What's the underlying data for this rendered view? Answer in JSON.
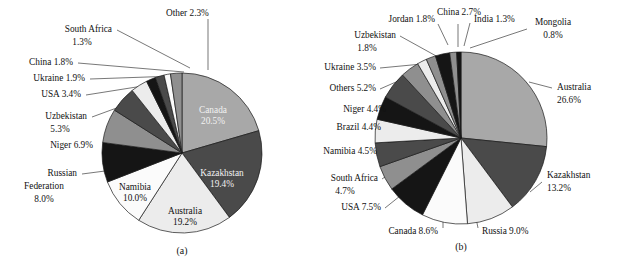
{
  "figure": {
    "width": 626,
    "height": 277,
    "background": "#ffffff",
    "panels": [
      {
        "id": "a",
        "caption": "(a)",
        "center": {
          "x": 182,
          "y": 153
        },
        "radius": 80
      },
      {
        "id": "b",
        "caption": "(b)",
        "center": {
          "x": 461,
          "y": 138
        },
        "radius": 86
      }
    ]
  },
  "palette": {
    "light_gray": "#a8a8a8",
    "dark_gray": "#4a4a4a",
    "near_white": "#ececec",
    "black": "#151515",
    "mid_gray": "#8f8f8f",
    "white": "#fbfbfb",
    "outline": "#1a1a1a",
    "text": "#111111",
    "leader": "#3d3d3d"
  },
  "chart_data": [
    {
      "type": "pie",
      "id": "a",
      "title": "(a)",
      "start_angle_deg": 0,
      "direction": "clockwise",
      "categories": [
        "Canada",
        "Kazakhstan",
        "Australia",
        "Namibia",
        "Russian Federation",
        "Niger",
        "Uzbekistan",
        "USA",
        "Ukraine",
        "China",
        "South Africa",
        "Other"
      ],
      "values": [
        20.5,
        19.4,
        19.2,
        10.0,
        8.0,
        6.9,
        5.3,
        3.4,
        1.9,
        1.8,
        1.3,
        2.3
      ],
      "unit": "%",
      "slices": [
        {
          "label": "Canada",
          "value": 20.5,
          "value_text": "20.5%",
          "color": "#a8a8a8",
          "label_text": "Canada\n20.5%",
          "placement": "inside",
          "text_tone": "light"
        },
        {
          "label": "Kazakhstan",
          "value": 19.4,
          "value_text": "19.4%",
          "color": "#4a4a4a",
          "label_text": "Kazakhstan\n19.4%",
          "placement": "inside",
          "text_tone": "light"
        },
        {
          "label": "Australia",
          "value": 19.2,
          "value_text": "19.2%",
          "color": "#ececec",
          "label_text": "Australia\n19.2%",
          "placement": "inside",
          "text_tone": "dark"
        },
        {
          "label": "Namibia",
          "value": 10.0,
          "value_text": "10.0%",
          "color": "#fbfbfb",
          "label_text": "Namibia\n10.0%",
          "placement": "inside",
          "text_tone": "dark"
        },
        {
          "label": "Russian Federation",
          "value": 8.0,
          "value_text": "8.0%",
          "color": "#151515",
          "label_text": "Russian\nFederation\n8.0%",
          "placement": "outside",
          "text_tone": "dark"
        },
        {
          "label": "Niger",
          "value": 6.9,
          "value_text": "6.9%",
          "color": "#8f8f8f",
          "label_text": "Niger 6.9%",
          "placement": "outside",
          "text_tone": "dark"
        },
        {
          "label": "Uzbekistan",
          "value": 5.3,
          "value_text": "5.3%",
          "color": "#4a4a4a",
          "label_text": "Uzbekistan\n5.3%",
          "placement": "outside",
          "text_tone": "dark"
        },
        {
          "label": "USA",
          "value": 3.4,
          "value_text": "3.4%",
          "color": "#ececec",
          "label_text": "USA 3.4%",
          "placement": "outside",
          "text_tone": "dark"
        },
        {
          "label": "Ukraine",
          "value": 1.9,
          "value_text": "1.9%",
          "color": "#151515",
          "label_text": "Ukraine 1.9%",
          "placement": "outside",
          "text_tone": "dark"
        },
        {
          "label": "China",
          "value": 1.8,
          "value_text": "1.8%",
          "color": "#4a4a4a",
          "label_text": "China 1.8%",
          "placement": "outside",
          "text_tone": "dark"
        },
        {
          "label": "South Africa",
          "value": 1.3,
          "value_text": "1.3%",
          "color": "#fbfbfb",
          "label_text": "South Africa\n1.3%",
          "placement": "outside",
          "text_tone": "dark"
        },
        {
          "label": "Other",
          "value": 2.3,
          "value_text": "2.3%",
          "color": "#8f8f8f",
          "label_text": "Other 2.3%",
          "placement": "outside",
          "text_tone": "dark"
        }
      ]
    },
    {
      "type": "pie",
      "id": "b",
      "title": "(b)",
      "start_angle_deg": 0,
      "direction": "clockwise",
      "categories": [
        "Australia",
        "Kazakhstan",
        "Russia",
        "Canada",
        "USA",
        "South Africa",
        "Namibia",
        "Brazil",
        "Niger",
        "Others",
        "Ukraine",
        "Uzbekistan",
        "Jordan",
        "China",
        "India",
        "Mongolia"
      ],
      "values": [
        26.6,
        13.2,
        9.0,
        8.6,
        7.5,
        4.7,
        4.5,
        4.4,
        4.4,
        5.2,
        3.5,
        1.8,
        1.8,
        2.7,
        1.3,
        0.8
      ],
      "unit": "%",
      "slices": [
        {
          "label": "Australia",
          "value": 26.6,
          "value_text": "26.6%",
          "color": "#a8a8a8",
          "label_text": "Australia\n26.6%",
          "placement": "outside"
        },
        {
          "label": "Kazakhstan",
          "value": 13.2,
          "value_text": "13.2%",
          "color": "#4a4a4a",
          "label_text": "Kazakhstan\n13.2%",
          "placement": "outside"
        },
        {
          "label": "Russia",
          "value": 9.0,
          "value_text": "9.0%",
          "color": "#ececec",
          "label_text": "Russia 9.0%",
          "placement": "outside"
        },
        {
          "label": "Canada",
          "value": 8.6,
          "value_text": "8.6%",
          "color": "#fbfbfb",
          "label_text": "Canada 8.6%",
          "placement": "outside"
        },
        {
          "label": "USA",
          "value": 7.5,
          "value_text": "7.5%",
          "color": "#151515",
          "label_text": "USA 7.5%",
          "placement": "outside"
        },
        {
          "label": "South Africa",
          "value": 4.7,
          "value_text": "4.7%",
          "color": "#8f8f8f",
          "label_text": "South Africa\n4.7%",
          "placement": "outside"
        },
        {
          "label": "Namibia",
          "value": 4.5,
          "value_text": "4.5%",
          "color": "#4a4a4a",
          "label_text": "Namibia 4.5%",
          "placement": "outside"
        },
        {
          "label": "Brazil",
          "value": 4.4,
          "value_text": "4.4%",
          "color": "#ececec",
          "label_text": "Brazil 4.4%",
          "placement": "outside"
        },
        {
          "label": "Niger",
          "value": 4.4,
          "value_text": "4.4%",
          "color": "#151515",
          "label_text": "Niger 4.4%",
          "placement": "outside"
        },
        {
          "label": "Others",
          "value": 5.2,
          "value_text": "5.2%",
          "color": "#4a4a4a",
          "label_text": "Others 5.2%",
          "placement": "outside"
        },
        {
          "label": "Ukraine",
          "value": 3.5,
          "value_text": "3.5%",
          "color": "#8f8f8f",
          "label_text": "Ukraine 3.5%",
          "placement": "outside"
        },
        {
          "label": "Uzbekistan",
          "value": 1.8,
          "value_text": "1.8%",
          "color": "#ececec",
          "label_text": "Uzbekistan\n1.8%",
          "placement": "outside"
        },
        {
          "label": "Jordan",
          "value": 1.8,
          "value_text": "1.8%",
          "color": "#8f8f8f",
          "label_text": "Jordan 1.8%",
          "placement": "outside"
        },
        {
          "label": "China",
          "value": 2.7,
          "value_text": "2.7%",
          "color": "#151515",
          "label_text": "China 2.7%",
          "placement": "outside"
        },
        {
          "label": "India",
          "value": 1.3,
          "value_text": "1.3%",
          "color": "#8f8f8f",
          "label_text": "India 1.3%",
          "placement": "outside"
        },
        {
          "label": "Mongolia",
          "value": 0.8,
          "value_text": "0.8%",
          "color": "#151515",
          "label_text": "Mongolia\n0.8%",
          "placement": "outside"
        }
      ]
    }
  ],
  "labels_a": {
    "other": {
      "line1": "Other 2.3%"
    },
    "south_africa": {
      "line1": "South Africa",
      "line2": "1.3%"
    },
    "china": {
      "line1": "China 1.8%"
    },
    "ukraine": {
      "line1": "Ukraine 1.9%"
    },
    "usa": {
      "line1": "USA 3.4%"
    },
    "uzbekistan": {
      "line1": "Uzbekistan",
      "line2": "5.3%"
    },
    "niger": {
      "line1": "Niger 6.9%"
    },
    "russia": {
      "line1": "Russian",
      "line2": "Federation",
      "line3": "8.0%"
    },
    "canada": {
      "line1": "Canada",
      "line2": "20.5%"
    },
    "kazakhstan": {
      "line1": "Kazakhstan",
      "line2": "19.4%"
    },
    "australia": {
      "line1": "Australia",
      "line2": "19.2%"
    },
    "namibia": {
      "line1": "Namibia",
      "line2": "10.0%"
    },
    "caption": "(a)"
  },
  "labels_b": {
    "jordan": {
      "line1": "Jordan 1.8%"
    },
    "china": {
      "line1": "China 2.7%"
    },
    "india": {
      "line1": "India 1.3%"
    },
    "mongolia": {
      "line1": "Mongolia",
      "line2": "0.8%"
    },
    "uzbekistan": {
      "line1": "Uzbekistan",
      "line2": "1.8%"
    },
    "ukraine": {
      "line1": "Ukraine 3.5%"
    },
    "others": {
      "line1": "Others 5.2%"
    },
    "niger": {
      "line1": "Niger 4.4%"
    },
    "brazil": {
      "line1": "Brazil 4.4%"
    },
    "namibia": {
      "line1": "Namibia 4.5%"
    },
    "south_africa": {
      "line1": "South Africa",
      "line2": "4.7%"
    },
    "usa": {
      "line1": "USA 7.5%"
    },
    "canada": {
      "line1": "Canada 8.6%"
    },
    "russia": {
      "line1": "Russia 9.0%"
    },
    "kazakhstan": {
      "line1": "Kazakhstan",
      "line2": "13.2%"
    },
    "australia": {
      "line1": "Australia",
      "line2": "26.6%"
    },
    "caption": "(b)"
  }
}
